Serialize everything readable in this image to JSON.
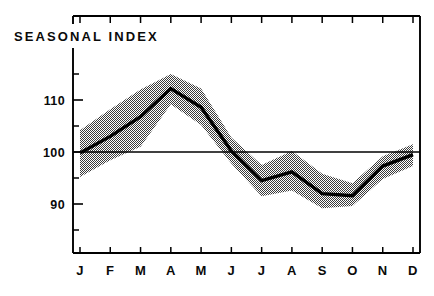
{
  "chart_data": {
    "type": "line",
    "title": "SEASONAL INDEX",
    "xlabel": "",
    "ylabel": "",
    "categories": [
      "J",
      "F",
      "M",
      "A",
      "M",
      "J",
      "J",
      "A",
      "S",
      "O",
      "N",
      "D"
    ],
    "category_names": [
      "January",
      "February",
      "March",
      "April",
      "May",
      "June",
      "July",
      "August",
      "September",
      "October",
      "November",
      "December"
    ],
    "series": [
      {
        "name": "Seasonal index",
        "values": [
          99.8,
          103.0,
          106.8,
          112.2,
          108.6,
          100.2,
          94.5,
          96.2,
          92.0,
          91.6,
          97.3,
          99.5
        ]
      },
      {
        "name": "Upper band",
        "values": [
          104.2,
          108.2,
          112.0,
          115.0,
          112.2,
          102.8,
          97.5,
          100.2,
          95.8,
          94.0,
          99.2,
          101.5
        ]
      },
      {
        "name": "Lower band",
        "values": [
          95.2,
          98.4,
          101.0,
          109.2,
          105.2,
          97.8,
          91.5,
          92.6,
          89.2,
          89.6,
          94.8,
          97.3
        ]
      }
    ],
    "reference_line": 100,
    "ylim": [
      82,
      117
    ],
    "ytick_values": [
      90,
      100,
      110
    ],
    "ytick_labels": [
      "90",
      "100",
      "110"
    ],
    "yminor_values": [
      85,
      95,
      105,
      115
    ],
    "grid": false,
    "legend": false,
    "legend_position": "none",
    "band_description": "stippled gray confidence band",
    "colors": {
      "line": "#000000",
      "band": "#a8a8a8",
      "axis": "#000000",
      "text": "#0a0a0a",
      "background": "#ffffff"
    }
  }
}
